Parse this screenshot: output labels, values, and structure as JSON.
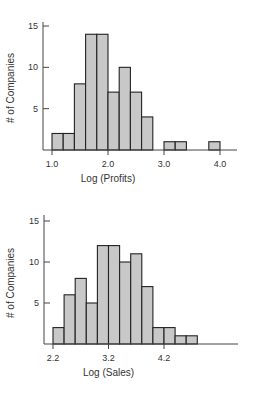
{
  "chart_data": [
    {
      "type": "bar",
      "subtype": "histogram",
      "title": "",
      "xlabel": "Log (Profits)",
      "ylabel": "# of Companies",
      "bin_width": 0.2,
      "bin_start": 1.0,
      "bins": [
        "1.0-1.2",
        "1.2-1.4",
        "1.4-1.6",
        "1.6-1.8",
        "1.8-2.0",
        "2.0-2.2",
        "2.2-2.4",
        "2.4-2.6",
        "2.6-2.8",
        "2.8-3.0",
        "3.0-3.2",
        "3.2-3.4",
        "3.4-3.6",
        "3.6-3.8",
        "3.8-4.0"
      ],
      "values": [
        2,
        2,
        8,
        14,
        14,
        7,
        10,
        7,
        4,
        0,
        1,
        1,
        0,
        0,
        1
      ],
      "xticks": [
        1.0,
        2.0,
        3.0,
        4.0
      ],
      "xtick_labels": [
        "1.0",
        "2.0",
        "3.0",
        "4.0"
      ],
      "yticks": [
        5,
        10,
        15
      ],
      "ytick_labels": [
        "5",
        "10",
        "15"
      ],
      "xlim": [
        0.85,
        4.3
      ],
      "ylim": [
        0,
        15.5
      ],
      "grid": false,
      "bar_color": "#c8c8c8",
      "edge_color": "#222222"
    },
    {
      "type": "bar",
      "subtype": "histogram",
      "title": "",
      "xlabel": "Log (Sales)",
      "ylabel": "# of Companies",
      "bin_width": 0.2,
      "bin_start": 2.2,
      "bins": [
        "2.2-2.4",
        "2.4-2.6",
        "2.6-2.8",
        "2.8-3.0",
        "3.0-3.2",
        "3.2-3.4",
        "3.4-3.6",
        "3.6-3.8",
        "3.8-4.0",
        "4.0-4.2",
        "4.2-4.4",
        "4.4-4.6",
        "4.6-4.8"
      ],
      "values": [
        2,
        6,
        8,
        5,
        12,
        12,
        10,
        11,
        7,
        2,
        2,
        1,
        1
      ],
      "xticks": [
        2.2,
        3.2,
        4.2
      ],
      "xtick_labels": [
        "2.2",
        "3.2",
        "4.2"
      ],
      "yticks": [
        5,
        10,
        15
      ],
      "ytick_labels": [
        "5",
        "10",
        "15"
      ],
      "xlim": [
        2.05,
        5.5
      ],
      "ylim": [
        0,
        15.5
      ],
      "grid": false,
      "bar_color": "#c8c8c8",
      "edge_color": "#222222"
    }
  ]
}
